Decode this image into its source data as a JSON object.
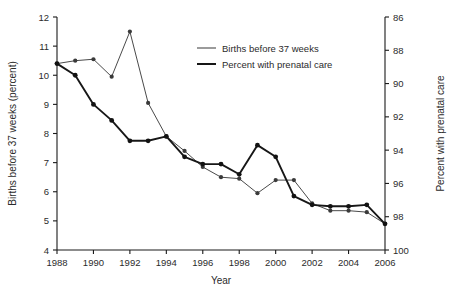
{
  "chart_data": {
    "type": "line",
    "title": "",
    "xlabel": "Year",
    "ylabel": "Births before 37 weeks (percent)",
    "y2label": "Percent with prenatal care",
    "xlim": [
      1987,
      2007
    ],
    "ylim": [
      4,
      12
    ],
    "y2lim": [
      86,
      100
    ],
    "y2_inverted": true,
    "grid": false,
    "legend_position": "top-center",
    "x": [
      1988,
      1989,
      1990,
      1991,
      1992,
      1993,
      1994,
      1995,
      1996,
      1997,
      1998,
      1999,
      2000,
      2001,
      2002,
      2003,
      2004,
      2005,
      2006
    ],
    "xticks": [
      1988,
      1990,
      1992,
      1994,
      1996,
      1998,
      2000,
      2002,
      2004,
      2006
    ],
    "xticklabels": [
      "1988",
      "1990",
      "1992",
      "1994",
      "1996",
      "1998",
      "2000",
      "2002",
      "2004",
      "2006"
    ],
    "yticks": [
      4,
      5,
      6,
      7,
      8,
      9,
      10,
      11,
      12
    ],
    "yticklabels": [
      "4",
      "5",
      "6",
      "7",
      "8",
      "9",
      "10",
      "11",
      "12"
    ],
    "y2ticks": [
      86,
      88,
      90,
      92,
      94,
      96,
      98,
      100
    ],
    "y2ticklabels": [
      "86",
      "88",
      "90",
      "92",
      "94",
      "96",
      "98",
      "100"
    ],
    "series": [
      {
        "name": "Births before 37 weeks",
        "axis": "left",
        "style": "thin",
        "values": [
          10.4,
          10.5,
          10.55,
          9.95,
          11.5,
          9.05,
          7.9,
          7.4,
          6.85,
          6.5,
          6.45,
          5.95,
          6.4,
          6.4,
          5.6,
          5.35,
          5.35,
          5.3,
          4.9
        ]
      },
      {
        "name": "Percent with prenatal care",
        "axis": "right",
        "style": "thick",
        "values_left_scale": [
          10.4,
          10.0,
          9.0,
          8.45,
          7.75,
          7.75,
          7.9,
          7.2,
          6.95,
          6.95,
          6.6,
          7.6,
          7.2,
          5.85,
          5.55,
          5.5,
          5.5,
          5.55,
          4.9
        ],
        "values": [
          88.1,
          88.8,
          90.5,
          91.5,
          92.7,
          92.7,
          92.5,
          93.7,
          94.1,
          94.1,
          94.7,
          92.9,
          93.6,
          96.0,
          96.5,
          96.6,
          96.6,
          96.5,
          97.7
        ]
      }
    ],
    "legend": [
      {
        "label": "Births before 37 weeks",
        "style": "thin"
      },
      {
        "label": "Percent with prenatal care",
        "style": "thick"
      }
    ]
  }
}
